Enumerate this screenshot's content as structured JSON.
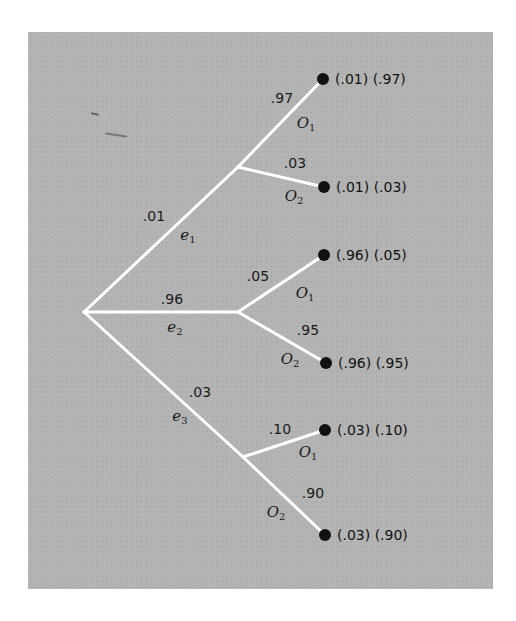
{
  "diagram": {
    "type": "probability-tree",
    "root": {
      "x": 84,
      "y": 312
    },
    "first_level": [
      {
        "event": "e",
        "event_sub": "1",
        "prob": ".01",
        "node": {
          "x": 238,
          "y": 167
        },
        "prob_pos": {
          "x": 154,
          "y": 216
        },
        "event_pos": {
          "x": 188,
          "y": 236
        },
        "outcomes": [
          {
            "label": "O",
            "label_sub": "1",
            "prob": ".97",
            "leaf": {
              "x": 323,
              "y": 79
            },
            "prob_pos": {
              "x": 282,
              "y": 98
            },
            "label_pos": {
              "x": 306,
              "y": 124
            },
            "result": "(.01) (.97)"
          },
          {
            "label": "O",
            "label_sub": "2",
            "prob": ".03",
            "leaf": {
              "x": 324,
              "y": 187
            },
            "prob_pos": {
              "x": 295,
              "y": 163
            },
            "label_pos": {
              "x": 294,
              "y": 197
            },
            "result": "(.01) (.03)"
          }
        ]
      },
      {
        "event": "e",
        "event_sub": "2",
        "prob": ".96",
        "node": {
          "x": 238,
          "y": 312
        },
        "prob_pos": {
          "x": 172,
          "y": 299
        },
        "event_pos": {
          "x": 175,
          "y": 328
        },
        "outcomes": [
          {
            "label": "O",
            "label_sub": "1",
            "prob": ".05",
            "leaf": {
              "x": 324,
              "y": 255
            },
            "prob_pos": {
              "x": 258,
              "y": 276
            },
            "label_pos": {
              "x": 305,
              "y": 294
            },
            "result": "(.96) (.05)"
          },
          {
            "label": "O",
            "label_sub": "2",
            "prob": ".95",
            "leaf": {
              "x": 326,
              "y": 363
            },
            "prob_pos": {
              "x": 308,
              "y": 330
            },
            "label_pos": {
              "x": 290,
              "y": 360
            },
            "result": "(.96) (.95)"
          }
        ]
      },
      {
        "event": "e",
        "event_sub": "3",
        "prob": ".03",
        "node": {
          "x": 243,
          "y": 457
        },
        "prob_pos": {
          "x": 200,
          "y": 392
        },
        "event_pos": {
          "x": 180,
          "y": 417
        },
        "outcomes": [
          {
            "label": "O",
            "label_sub": "1",
            "prob": ".10",
            "leaf": {
              "x": 325,
              "y": 430
            },
            "prob_pos": {
              "x": 280,
              "y": 429
            },
            "label_pos": {
              "x": 308,
              "y": 453
            },
            "result": "(.03) (.10)"
          },
          {
            "label": "O",
            "label_sub": "2",
            "prob": ".90",
            "leaf": {
              "x": 325,
              "y": 535
            },
            "prob_pos": {
              "x": 313,
              "y": 493
            },
            "label_pos": {
              "x": 276,
              "y": 513
            },
            "result": "(.03) (.90)"
          }
        ]
      }
    ]
  },
  "colors": {
    "background": "#b3b3b3",
    "branch": "#ffffff",
    "dot": "#111111",
    "text": "#1a1a1a"
  }
}
